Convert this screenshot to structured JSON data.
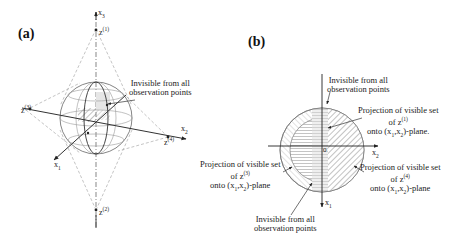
{
  "figure": {
    "panel_a": {
      "label": "(a)",
      "axes": {
        "x1": "x1",
        "x2": "x2",
        "x3": "x3"
      },
      "points": {
        "z1": "z(1)",
        "z2": "z(2)",
        "z3": "z(3)",
        "z4": "z(4)"
      },
      "annotation": {
        "line1": "Invisible from all",
        "line2": "observation points"
      }
    },
    "panel_b": {
      "label": "(b)",
      "axes": {
        "x1": "x1",
        "x2": "x2",
        "origin": "0"
      },
      "annotations": {
        "top_invisible": {
          "line1": "Invisible from all",
          "line2": "observation points"
        },
        "proj_z1": {
          "line1": "Projection of visible set",
          "line2": "of z(1)",
          "line3": "onto (x1,x2)-plane."
        },
        "proj_z3": {
          "line1": "Projection of visible set",
          "line2": "of z(3)",
          "line3": "onto (x1,x2)-plane"
        },
        "proj_z4": {
          "line1": "Projection of visible set",
          "line2": "of z(4)",
          "line3": "onto (x1,x2)-plane"
        },
        "bottom_invisible": {
          "line1": "Invisible from all",
          "line2": "observation points"
        }
      }
    },
    "colors": {
      "line": "#333333",
      "dashed": "#999999",
      "hatch": "#777777",
      "background": "#ffffff"
    }
  }
}
